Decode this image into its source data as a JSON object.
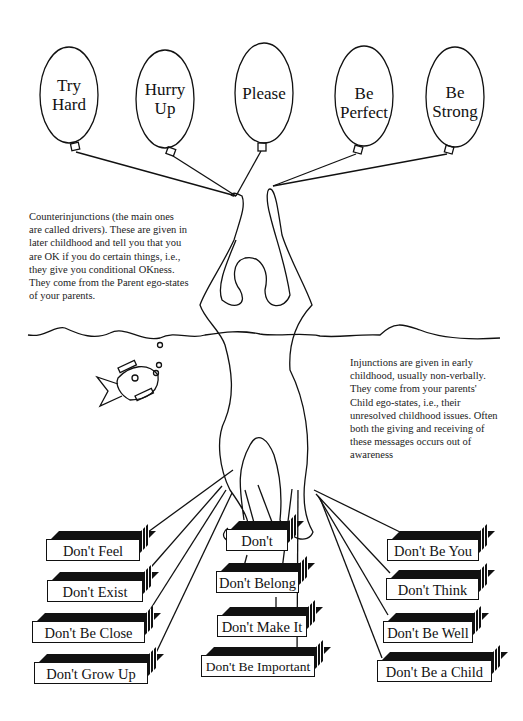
{
  "balloons": [
    {
      "label": "Try Hard",
      "line1": "Try",
      "line2": "Hard"
    },
    {
      "label": "Hurry Up",
      "line1": "Hurry",
      "line2": "Up"
    },
    {
      "label": "Please",
      "line1": "Please",
      "line2": ""
    },
    {
      "label": "Be Perfect",
      "line1": "Be",
      "line2": "Perfect"
    },
    {
      "label": "Be Strong",
      "line1": "Be",
      "line2": "Strong"
    }
  ],
  "notes": {
    "counterinjunctions": "Counterinjunctions (the main ones are called drivers). These are given in later childhood and tell you that you are OK if you do certain things, i.e., they give you conditional OKness. They come from the Parent ego-states of your parents.",
    "injunctions": "Injunctions are given in early childhood, usually non-verbally. They come from your parents' Child ego-states, i.e., their unresolved childhood issues. Often both the giving and receiving of these messages occurs out of awareness"
  },
  "injunctions": {
    "left": [
      "Don't Feel",
      "Don't Exist",
      "Don't Be Close",
      "Don't Grow Up"
    ],
    "center": [
      "Don't",
      "Don't Belong",
      "Don't Make It",
      "Don't Be Important"
    ],
    "right": [
      "Don't Be You",
      "Don't Think",
      "Don't Be Well",
      "Don't Be a Child"
    ]
  }
}
